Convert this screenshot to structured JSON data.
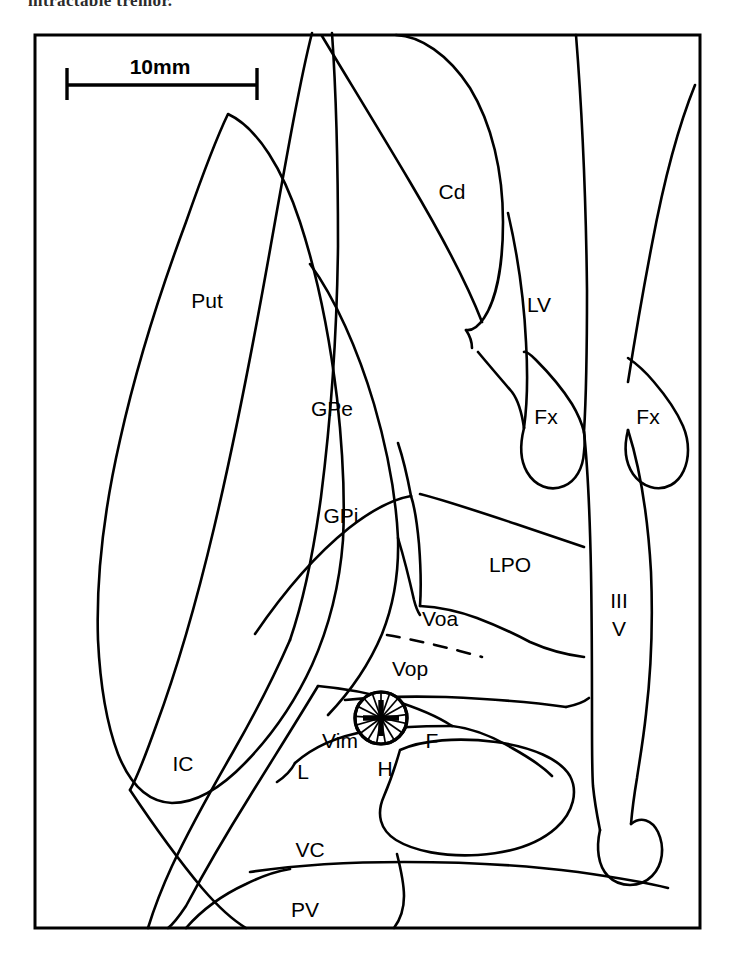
{
  "page": {
    "header_text": "intractable tremor.",
    "background_color": "#ffffff",
    "ink_color": "#000000"
  },
  "figure": {
    "name": "thalamic-atlas-diagram",
    "scale_bar": {
      "label": "10mm",
      "length_px": 190
    },
    "frame": {
      "x": 35,
      "y": 35,
      "width": 665,
      "height": 893
    },
    "target_marker": {
      "name": "electrode-target-vim",
      "cx": 381,
      "cy": 718,
      "r": 27,
      "style": "radial-hatched-circle-with-cross"
    },
    "labels": [
      {
        "id": "put",
        "text": "Put",
        "x": 207,
        "y": 302
      },
      {
        "id": "cd",
        "text": "Cd",
        "x": 452,
        "y": 193
      },
      {
        "id": "lv",
        "text": "LV",
        "x": 539,
        "y": 306
      },
      {
        "id": "gpe",
        "text": "GPe",
        "x": 332,
        "y": 410
      },
      {
        "id": "gpi",
        "text": "GPi",
        "x": 341,
        "y": 517
      },
      {
        "id": "fx1",
        "text": "Fx",
        "x": 546,
        "y": 418
      },
      {
        "id": "fx2",
        "text": "Fx",
        "x": 648,
        "y": 418
      },
      {
        "id": "lpo",
        "text": "LPO",
        "x": 510,
        "y": 566
      },
      {
        "id": "voa",
        "text": "Voa",
        "x": 440,
        "y": 620
      },
      {
        "id": "vop",
        "text": "Vop",
        "x": 410,
        "y": 670
      },
      {
        "id": "iii",
        "text": "III",
        "x": 619,
        "y": 602
      },
      {
        "id": "v",
        "text": "V",
        "x": 619,
        "y": 630
      },
      {
        "id": "vim",
        "text": "Vim",
        "x": 340,
        "y": 742
      },
      {
        "id": "f",
        "text": "F",
        "x": 432,
        "y": 742
      },
      {
        "id": "l",
        "text": "L",
        "x": 303,
        "y": 773
      },
      {
        "id": "h",
        "text": "H",
        "x": 385,
        "y": 770
      },
      {
        "id": "ic",
        "text": "IC",
        "x": 183,
        "y": 765
      },
      {
        "id": "vc",
        "text": "VC",
        "x": 310,
        "y": 851
      },
      {
        "id": "pv",
        "text": "PV",
        "x": 305,
        "y": 911
      }
    ]
  }
}
